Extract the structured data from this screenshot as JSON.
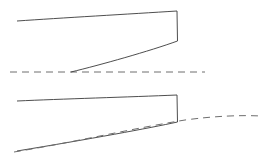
{
  "figure": {
    "title": "",
    "background_color": "#ffffff",
    "width": 269,
    "height": 164,
    "solid_line_color": "#3a3a3a",
    "dashed_line_color": "#6e6e6e",
    "panels": [
      {
        "name": "upper-panel",
        "label": "",
        "shape": {
          "name": "upper-section-outline",
          "description": "curved quadrilateral with vertical right edge",
          "top_curve": "M 17,21 C 60,18 130,14 177,11",
          "right_edge": "M 177,11 L 177.5,41",
          "bottom_curve": "M 177.5,41 C 150,51 100,65 71,72",
          "closed": false
        },
        "reference_line": {
          "name": "upper-datum-line",
          "style": "dashed",
          "path": "M 10,72 L 205,72",
          "y": 72,
          "x_start": 10,
          "x_end": 205
        },
        "intersection_point": {
          "x": 71,
          "y": 72
        }
      },
      {
        "name": "lower-panel",
        "label": "",
        "shape": {
          "name": "lower-section-outline",
          "description": "curved quadrilateral with vertical right edge",
          "top_curve": "M 17,101 C 60,99 130,97 177,95",
          "right_edge": "M 177,95 L 177.5,122",
          "bottom_curve": "M 177.5,122 C 150,128 90,139 17,151",
          "closed": false
        },
        "reference_line": {
          "name": "lower-datum-curve",
          "style": "dashed",
          "path": "M 14,152 C 70,143 130,129 185,120 C 215,116 240,115 261,116",
          "x_start": 14,
          "x_end": 261
        },
        "intersection_point": {
          "x": 177,
          "y": 121
        }
      }
    ]
  }
}
